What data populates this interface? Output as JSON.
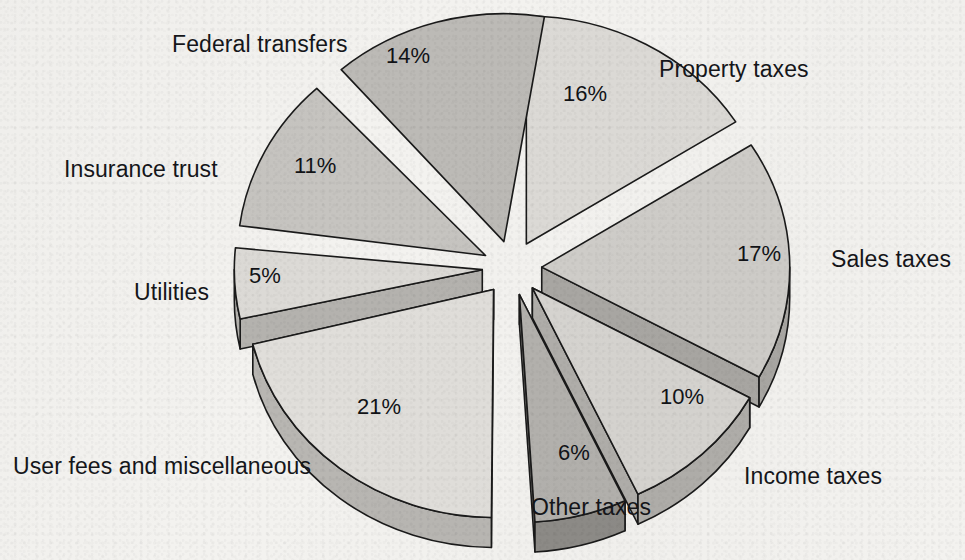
{
  "chart_data": {
    "type": "pie",
    "title": "",
    "subtitle": "",
    "xlabel": "",
    "ylabel": "",
    "legend_position": "none",
    "grid": false,
    "style": "3d-exploded-pie",
    "units": "percent",
    "total": 100,
    "categories": [
      "Property taxes",
      "Sales taxes",
      "Income taxes",
      "Other taxes",
      "User fees and miscellaneous",
      "Utilities",
      "Insurance trust",
      "Federal transfers"
    ],
    "values": [
      16,
      17,
      10,
      6,
      21,
      5,
      11,
      14
    ],
    "value_labels": [
      "16%",
      "17%",
      "10%",
      "6%",
      "21%",
      "5%",
      "11%",
      "14%"
    ],
    "slices": [
      {
        "label": "Property taxes",
        "value": 16,
        "value_label": "16%",
        "top_color": "#dcdad6",
        "side_color": "#b4b2ae",
        "start_angle": -90,
        "end_angle": -32.4,
        "explode": 0.12
      },
      {
        "label": "Sales taxes",
        "value": 17,
        "value_label": "17%",
        "top_color": "#cfcdc9",
        "side_color": "#a9a7a3",
        "start_angle": -32.4,
        "end_angle": 28.8,
        "explode": 0.12
      },
      {
        "label": "Income taxes",
        "value": 10,
        "value_label": "10%",
        "top_color": "#d6d4d0",
        "side_color": "#b0aeaa",
        "start_angle": 28.8,
        "end_angle": 64.8,
        "explode": 0.12
      },
      {
        "label": "Other taxes",
        "value": 6,
        "value_label": "6%",
        "top_color": "#b3b1ad",
        "side_color": "#8d8b87",
        "start_angle": 64.8,
        "end_angle": 86.4,
        "explode": 0.12
      },
      {
        "label": "User fees and miscellaneous",
        "value": 21,
        "value_label": "21%",
        "top_color": "#e0deda",
        "side_color": "#b8b6b2",
        "start_angle": 90.5,
        "end_angle": 166.1,
        "explode": 0.12
      },
      {
        "label": "Utilities",
        "value": 5,
        "value_label": "5%",
        "top_color": "#dcdad6",
        "side_color": "#b4b2ae",
        "start_angle": 167.5,
        "end_angle": 185.5,
        "explode": 0.12
      },
      {
        "label": "Insurance trust",
        "value": 11,
        "value_label": "11%",
        "top_color": "#c6c4c0",
        "side_color": "#a09e9a",
        "start_angle": 187.5,
        "end_angle": 227.1,
        "explode": 0.12
      },
      {
        "label": "Federal transfers",
        "value": 14,
        "value_label": "14%",
        "top_color": "#bcbab6",
        "side_color": "#96948f",
        "start_angle": 229.0,
        "end_angle": 279.4,
        "explode": 0.12
      }
    ],
    "geometry": {
      "cx": 512,
      "cy": 268,
      "rx": 248,
      "ry": 228,
      "depth": 30,
      "stroke": "#1a1a1a",
      "stroke_width": 1.6,
      "background": "#f3f2ef"
    },
    "annotations": {
      "labels": [
        {
          "name": "federal-transfers",
          "text": "Federal transfers",
          "x": 172,
          "y": 31
        },
        {
          "name": "property-taxes",
          "text": "Property taxes",
          "x": 659,
          "y": 56
        },
        {
          "name": "insurance-trust",
          "text": "Insurance trust",
          "x": 64,
          "y": 156
        },
        {
          "name": "sales-taxes",
          "text": "Sales taxes",
          "x": 831,
          "y": 246
        },
        {
          "name": "utilities",
          "text": "Utilities",
          "x": 134,
          "y": 279
        },
        {
          "name": "user-fees",
          "text": "User fees and miscellaneous",
          "x": 13,
          "y": 453
        },
        {
          "name": "income-taxes",
          "text": "Income taxes",
          "x": 744,
          "y": 463
        },
        {
          "name": "other-taxes",
          "text": "Other taxes",
          "x": 531,
          "y": 494
        }
      ],
      "percents": [
        {
          "name": "federal-transfers",
          "text": "14%",
          "x": 386,
          "y": 44
        },
        {
          "name": "property-taxes",
          "text": "16%",
          "x": 563,
          "y": 82
        },
        {
          "name": "insurance-trust",
          "text": "11%",
          "x": 294,
          "y": 154
        },
        {
          "name": "sales-taxes",
          "text": "17%",
          "x": 737,
          "y": 242
        },
        {
          "name": "utilities",
          "text": "5%",
          "x": 249,
          "y": 264
        },
        {
          "name": "income-taxes",
          "text": "10%",
          "x": 660,
          "y": 385
        },
        {
          "name": "user-fees",
          "text": "21%",
          "x": 357,
          "y": 395
        },
        {
          "name": "other-taxes",
          "text": "6%",
          "x": 558,
          "y": 441
        }
      ]
    }
  }
}
